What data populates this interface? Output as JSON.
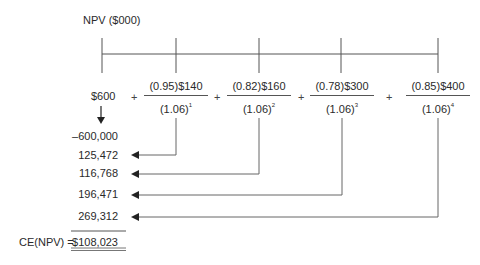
{
  "title": "NPV ($000)",
  "timeline": {
    "tick_x": [
      102,
      176,
      259,
      341,
      438
    ]
  },
  "equation": {
    "initial": "$600",
    "plus": "+",
    "terms": [
      {
        "numerator": "(0.95)$140",
        "denominator": "(1.06)",
        "exponent": "1"
      },
      {
        "numerator": "(0.82)$160",
        "denominator": "(1.06)",
        "exponent": "2"
      },
      {
        "numerator": "(0.78)$300",
        "denominator": "(1.06)",
        "exponent": "3"
      },
      {
        "numerator": "(0.85)$400",
        "denominator": "(1.06)",
        "exponent": "4"
      }
    ]
  },
  "values": [
    "–600,000",
    "125,472",
    "116,768",
    "196,471",
    "269,312"
  ],
  "result": {
    "label": "CE(NPV) =",
    "value": "$108,023"
  },
  "colors": {
    "line": "#555555",
    "text": "#2a2a2a"
  }
}
